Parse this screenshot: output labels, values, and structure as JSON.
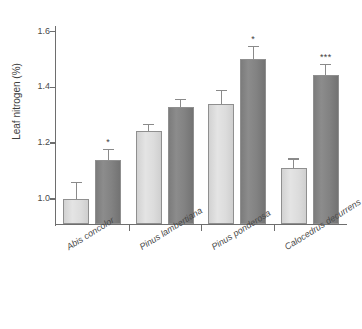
{
  "chart_data": {
    "type": "bar",
    "title": "",
    "xlabel": "",
    "ylabel": "Leaf nitrogen (%)",
    "ylim": [
      0.91,
      1.62
    ],
    "yticks": [
      "1.0",
      "1.2",
      "1.4",
      "1.6"
    ],
    "ytick_values": [
      1.0,
      1.2,
      1.4,
      1.6
    ],
    "grid": false,
    "legend": "none",
    "categories": [
      "Abis concolor",
      "Pinus lambertiana",
      "Pinus ponderosa",
      "Calocedrus decurrens"
    ],
    "series": [
      {
        "name": "light",
        "color": "#dcdcdc",
        "values": [
          1.0,
          1.245,
          1.34,
          1.11
        ],
        "errors": [
          0.06,
          0.025,
          0.05,
          0.035
        ],
        "significance": [
          "",
          "",
          "",
          ""
        ]
      },
      {
        "name": "dark",
        "color": "#808080",
        "values": [
          1.14,
          1.33,
          1.5,
          1.445
        ],
        "errors": [
          0.04,
          0.03,
          0.05,
          0.04
        ],
        "significance": [
          "*",
          "",
          "*",
          "***"
        ]
      }
    ]
  }
}
